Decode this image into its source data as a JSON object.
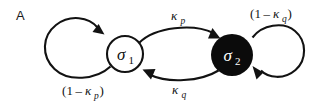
{
  "figure": {
    "panel_letter": "A",
    "background_color": "#ffffff",
    "ink_color": "#121212"
  },
  "nodes": [
    {
      "id": "sigma-1",
      "symbol": "σ",
      "subscript": "1",
      "style": "open",
      "fill_color": "#ffffff",
      "stroke_color": "#121212",
      "text_color": "#111111",
      "cx": 125,
      "cy": 54,
      "r": 18
    },
    {
      "id": "sigma-2",
      "symbol": "σ",
      "subscript": "2",
      "style": "filled",
      "fill_color": "#0b0b0b",
      "stroke_color": "#0b0b0b",
      "text_color": "#ffffff",
      "cx": 232,
      "cy": 55,
      "r": 21
    }
  ],
  "edges": [
    {
      "id": "self-loop-sigma1",
      "kind": "self-loop",
      "from": "sigma-1",
      "to": "sigma-1",
      "label": {
        "open_paren": "(",
        "one": "1",
        "minus": "–",
        "kappa": "κ",
        "subscript": "p",
        "close_paren": ")",
        "full_text": "(1 – κp)"
      },
      "label_position": "below-left"
    },
    {
      "id": "edge-sigma1-to-sigma2",
      "kind": "arc",
      "from": "sigma-1",
      "to": "sigma-2",
      "direction": "left-to-right",
      "label": {
        "kappa": "κ",
        "subscript": "p",
        "full_text": "κp"
      },
      "label_position": "above-center"
    },
    {
      "id": "edge-sigma2-to-sigma1",
      "kind": "arc",
      "from": "sigma-2",
      "to": "sigma-1",
      "direction": "right-to-left",
      "label": {
        "kappa": "κ",
        "subscript": "q",
        "full_text": "κq"
      },
      "label_position": "below-center"
    },
    {
      "id": "self-loop-sigma2",
      "kind": "self-loop",
      "from": "sigma-2",
      "to": "sigma-2",
      "label": {
        "open_paren": "(",
        "one": "1",
        "minus": "–",
        "kappa": "κ",
        "subscript": "q",
        "close_paren": ")",
        "full_text": "(1 – κq)"
      },
      "label_position": "above-right"
    }
  ]
}
